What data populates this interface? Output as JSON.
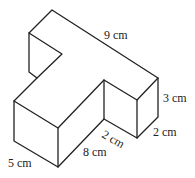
{
  "figure": {
    "type": "3D T-shaped prism (isometric)",
    "labels": {
      "top_length": "9 cm",
      "right_height": "3 cm",
      "right_depth": "2 cm",
      "inner_step": "2 cm",
      "front_length": "8 cm",
      "left_depth": "5 cm"
    },
    "line_color": "#222222",
    "background": "#ffffff"
  }
}
